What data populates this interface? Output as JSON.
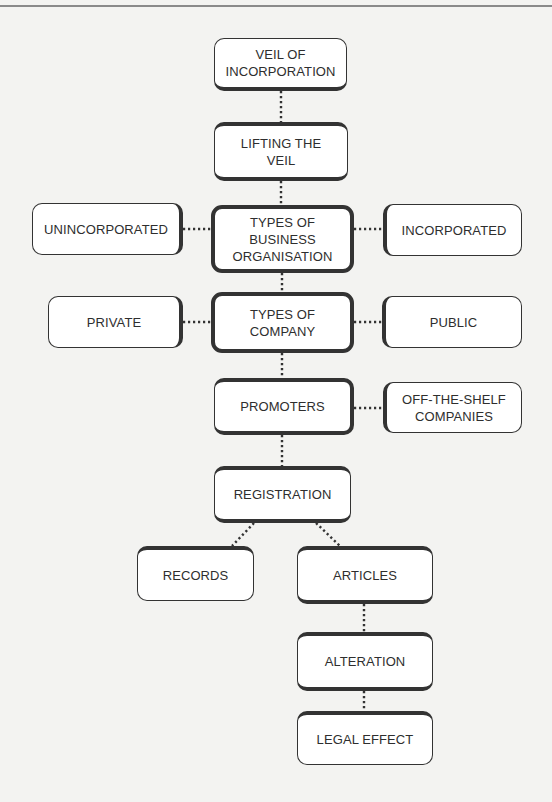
{
  "diagram": {
    "type": "flowchart",
    "nodes": {
      "veil_of_incorporation": "VEIL OF\nINCORPORATION",
      "lifting_the_veil": "LIFTING THE\nVEIL",
      "types_of_business_organisation": "TYPES OF\nBUSINESS\nORGANISATION",
      "unincorporated": "UNINCORPORATED",
      "incorporated": "INCORPORATED",
      "types_of_company": "TYPES OF\nCOMPANY",
      "private": "PRIVATE",
      "public": "PUBLIC",
      "promoters": "PROMOTERS",
      "off_the_shelf_companies": "OFF-THE-SHELF\nCOMPANIES",
      "registration": "REGISTRATION",
      "records": "RECORDS",
      "articles": "ARTICLES",
      "alteration": "ALTERATION",
      "legal_effect": "LEGAL EFFECT"
    },
    "edges": [
      [
        "veil_of_incorporation",
        "lifting_the_veil"
      ],
      [
        "lifting_the_veil",
        "types_of_business_organisation"
      ],
      [
        "types_of_business_organisation",
        "unincorporated"
      ],
      [
        "types_of_business_organisation",
        "incorporated"
      ],
      [
        "types_of_business_organisation",
        "types_of_company"
      ],
      [
        "types_of_company",
        "private"
      ],
      [
        "types_of_company",
        "public"
      ],
      [
        "types_of_company",
        "promoters"
      ],
      [
        "promoters",
        "off_the_shelf_companies"
      ],
      [
        "promoters",
        "registration"
      ],
      [
        "registration",
        "records"
      ],
      [
        "registration",
        "articles"
      ],
      [
        "articles",
        "alteration"
      ],
      [
        "alteration",
        "legal_effect"
      ]
    ],
    "colors": {
      "background": "#f3f3f1",
      "border": "#333333",
      "node_fill": "#ffffff",
      "connector": "#333333"
    }
  }
}
